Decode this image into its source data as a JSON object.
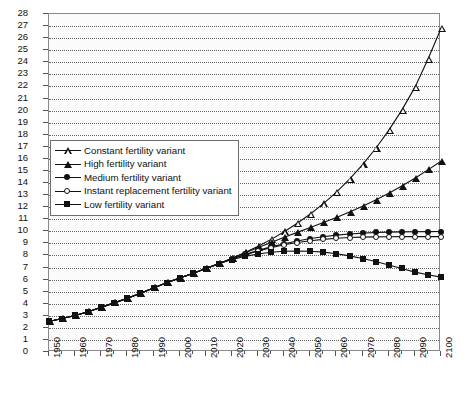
{
  "chart_data": {
    "type": "line",
    "title": "",
    "xlabel": "",
    "ylabel": "",
    "xlim": [
      1950,
      2100
    ],
    "ylim": [
      0,
      28
    ],
    "grid": true,
    "legend_position": "upper-left",
    "y_ticks": [
      0,
      1,
      2,
      3,
      4,
      5,
      6,
      7,
      8,
      9,
      10,
      11,
      12,
      13,
      14,
      15,
      16,
      17,
      18,
      19,
      20,
      21,
      22,
      23,
      24,
      25,
      26,
      27,
      28
    ],
    "x_ticks": [
      1950,
      1960,
      1970,
      1980,
      1990,
      2000,
      2010,
      2020,
      2030,
      2040,
      2050,
      2060,
      2070,
      2080,
      2090,
      2100
    ],
    "x_minor_step": 5,
    "x": [
      1950,
      1955,
      1960,
      1965,
      1970,
      1975,
      1980,
      1985,
      1990,
      1995,
      2000,
      2005,
      2010,
      2015,
      2020,
      2025,
      2030,
      2035,
      2040,
      2045,
      2050,
      2055,
      2060,
      2065,
      2070,
      2075,
      2080,
      2085,
      2090,
      2095,
      2100
    ],
    "series": [
      {
        "name": "Constant fertility variant",
        "marker": "open-triangle",
        "values": [
          2.53,
          2.77,
          3.03,
          3.33,
          3.7,
          4.07,
          4.45,
          4.86,
          5.31,
          5.74,
          6.13,
          6.51,
          6.91,
          7.32,
          7.76,
          8.24,
          8.76,
          9.33,
          9.96,
          10.66,
          11.43,
          12.29,
          13.25,
          14.32,
          15.52,
          16.86,
          18.36,
          20.04,
          21.92,
          24.25,
          26.8
        ]
      },
      {
        "name": "High fertility variant",
        "marker": "filled-triangle",
        "values": [
          2.53,
          2.77,
          3.03,
          3.33,
          3.7,
          4.07,
          4.45,
          4.86,
          5.31,
          5.74,
          6.13,
          6.51,
          6.91,
          7.32,
          7.76,
          8.21,
          8.65,
          9.08,
          9.5,
          9.91,
          10.31,
          10.72,
          11.14,
          11.59,
          12.07,
          12.59,
          13.15,
          13.75,
          14.4,
          15.09,
          15.8
        ]
      },
      {
        "name": "Medium fertility variant",
        "marker": "filled-circle",
        "values": [
          2.53,
          2.77,
          3.03,
          3.33,
          3.7,
          4.07,
          4.45,
          4.86,
          5.31,
          5.74,
          6.13,
          6.51,
          6.91,
          7.32,
          7.72,
          8.08,
          8.42,
          8.71,
          8.97,
          9.2,
          9.4,
          9.55,
          9.68,
          9.78,
          9.85,
          9.9,
          9.93,
          9.95,
          9.96,
          9.97,
          9.98
        ]
      },
      {
        "name": "Instant replacement fertility variant",
        "marker": "open-circle",
        "values": [
          2.53,
          2.77,
          3.03,
          3.33,
          3.7,
          4.07,
          4.45,
          4.86,
          5.31,
          5.74,
          6.13,
          6.51,
          6.91,
          7.32,
          7.7,
          8.04,
          8.36,
          8.64,
          8.88,
          9.07,
          9.22,
          9.33,
          9.42,
          9.48,
          9.52,
          9.54,
          9.55,
          9.56,
          9.56,
          9.56,
          9.56
        ]
      },
      {
        "name": "Low fertility variant",
        "marker": "filled-square",
        "values": [
          2.53,
          2.77,
          3.03,
          3.33,
          3.7,
          4.07,
          4.45,
          4.86,
          5.31,
          5.74,
          6.13,
          6.51,
          6.91,
          7.32,
          7.66,
          7.92,
          8.12,
          8.26,
          8.34,
          8.36,
          8.34,
          8.27,
          8.14,
          7.96,
          7.74,
          7.49,
          7.21,
          6.92,
          6.62,
          6.4,
          6.2
        ]
      }
    ]
  },
  "legend": {
    "items": [
      {
        "label": "Constant fertility variant"
      },
      {
        "label": "High fertility variant"
      },
      {
        "label": "Medium fertility variant"
      },
      {
        "label": "Instant replacement fertility variant"
      },
      {
        "label": "Low fertility variant"
      }
    ]
  }
}
